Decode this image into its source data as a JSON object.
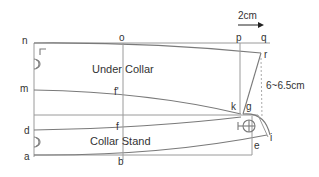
{
  "diagram": {
    "regions": {
      "under_collar": "Under Collar",
      "collar_stand": "Collar Stand"
    },
    "points": {
      "n": "n",
      "o": "o",
      "p": "p",
      "q": "q",
      "r": "r",
      "m": "m",
      "f_prime": "f'",
      "k": "k",
      "g": "g",
      "d": "d",
      "f": "f",
      "a": "a",
      "b": "b",
      "e": "e",
      "i": "i"
    },
    "measurements": {
      "offset": "2cm",
      "collar_width": "6~6.5cm"
    },
    "colors": {
      "line": "#9a9a9a",
      "text": "#333333",
      "arrow": "#222222"
    }
  }
}
